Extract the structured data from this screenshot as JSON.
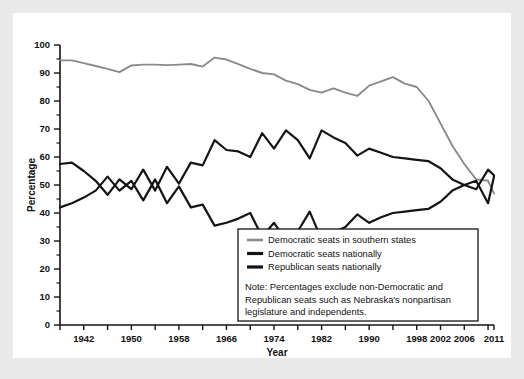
{
  "chart_data": {
    "type": "line",
    "title": "",
    "xlabel": "Year",
    "ylabel": "Percentage",
    "xlim": [
      1938,
      2011
    ],
    "ylim": [
      0,
      100
    ],
    "yticks": [
      0,
      10,
      20,
      30,
      40,
      50,
      60,
      70,
      80,
      90,
      100
    ],
    "xticks": [
      1942,
      1950,
      1958,
      1966,
      1974,
      1982,
      1990,
      1998,
      2002,
      2006,
      2011
    ],
    "xtick_labels": [
      "1942",
      "1950",
      "1958",
      "1966",
      "1974",
      "1982",
      "1990",
      "1998",
      "2002",
      "2006",
      "2011"
    ],
    "grid": false,
    "legend_position": "bottom-right",
    "x": [
      1938,
      1940,
      1942,
      1944,
      1946,
      1948,
      1950,
      1952,
      1954,
      1956,
      1958,
      1960,
      1962,
      1964,
      1966,
      1968,
      1970,
      1972,
      1974,
      1976,
      1978,
      1980,
      1982,
      1984,
      1986,
      1988,
      1990,
      1992,
      1994,
      1996,
      1998,
      2000,
      2002,
      2004,
      2006,
      2008,
      2010,
      2011
    ],
    "series": [
      {
        "name": "Democratic seats in southern states",
        "color": "#8a8a8a",
        "values": [
          94.5,
          94.5,
          93.5,
          92.5,
          91.5,
          90.3,
          92.7,
          93.0,
          93.0,
          92.8,
          93.0,
          93.2,
          92.3,
          95.5,
          94.8,
          93.2,
          91.5,
          90.0,
          89.5,
          87.3,
          86.0,
          84.0,
          83.0,
          84.5,
          83.0,
          81.8,
          85.5,
          87.0,
          88.5,
          86.2,
          85.0,
          80.0,
          72.0,
          64.0,
          57.5,
          52.0,
          51.5,
          47.0
        ]
      },
      {
        "name": "Democratic seats nationally",
        "color": "#141414",
        "values": [
          57.5,
          58.0,
          55.0,
          51.5,
          46.5,
          52.0,
          48.5,
          55.5,
          48.0,
          56.5,
          50.5,
          58.0,
          57.0,
          66.0,
          62.5,
          62.0,
          60.0,
          68.5,
          63.0,
          69.5,
          66.0,
          59.5,
          69.5,
          67.0,
          65.0,
          60.5,
          63.0,
          61.5,
          60.0,
          59.5,
          59.0,
          58.5,
          56.0,
          52.0,
          50.0,
          48.5,
          55.5,
          53.5
        ]
      },
      {
        "name": "Republican seats nationally",
        "color": "#141414",
        "values": [
          42.0,
          43.5,
          45.5,
          48.0,
          53.0,
          48.0,
          51.5,
          44.5,
          52.0,
          43.5,
          49.5,
          42.0,
          43.0,
          35.5,
          36.5,
          38.0,
          40.0,
          31.5,
          36.5,
          30.5,
          33.5,
          40.5,
          30.5,
          33.0,
          35.0,
          39.5,
          36.5,
          38.5,
          40.0,
          40.5,
          41.0,
          41.5,
          44.0,
          48.0,
          50.0,
          51.5,
          43.5,
          53.0
        ]
      }
    ],
    "legend_entries": [
      {
        "label": "Democratic seats in southern states",
        "color": "#8a8a8a"
      },
      {
        "label": "Democratic seats nationally",
        "color": "#141414"
      },
      {
        "label": "Republican seats nationally",
        "color": "#141414"
      }
    ],
    "note_lines": [
      "Note: Percentages exclude non-Democratic and",
      "Republican seats such as Nebraska's nonpartisan",
      "legislature and independents."
    ]
  }
}
